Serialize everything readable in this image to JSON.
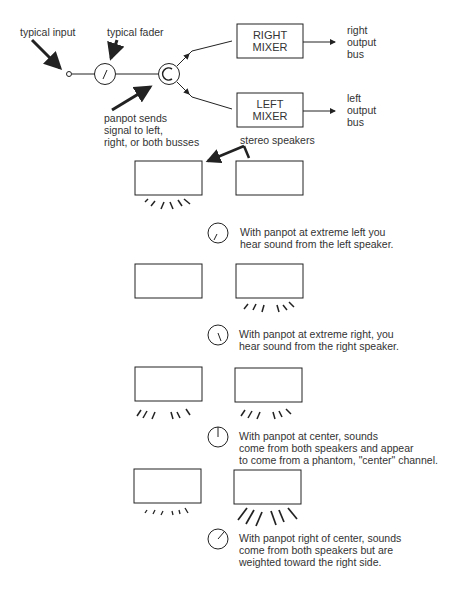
{
  "signal_chain": {
    "input_label": "typical input",
    "fader_label": "typical fader",
    "panpot_label": [
      "panpot sends",
      "signal to left,",
      "right, or both busses"
    ],
    "right_mixer": [
      "RIGHT",
      "MIXER"
    ],
    "left_mixer": [
      "LEFT",
      "MIXER"
    ],
    "right_bus": [
      "right",
      "output",
      "bus"
    ],
    "left_bus": [
      "left",
      "output",
      "bus"
    ],
    "speakers_label": "stereo speakers"
  },
  "scenarios": [
    {
      "name": "extreme-left",
      "knob": "left",
      "lines": [
        "With panpot at extreme left  you",
        "hear sound from the  left speaker."
      ]
    },
    {
      "name": "extreme-right",
      "knob": "right",
      "lines": [
        "With panpot at extreme right, you",
        "hear sound from the right speaker."
      ]
    },
    {
      "name": "center",
      "knob": "center",
      "lines": [
        "With panpot at center, sounds",
        "come from both speakers and appear",
        "to come from a phantom, \"center\" channel."
      ]
    },
    {
      "name": "right-of-center",
      "knob": "right-of-center",
      "lines": [
        "With panpot right of center, sounds",
        "come from both speakers but are",
        "weighted toward the right side."
      ]
    }
  ]
}
